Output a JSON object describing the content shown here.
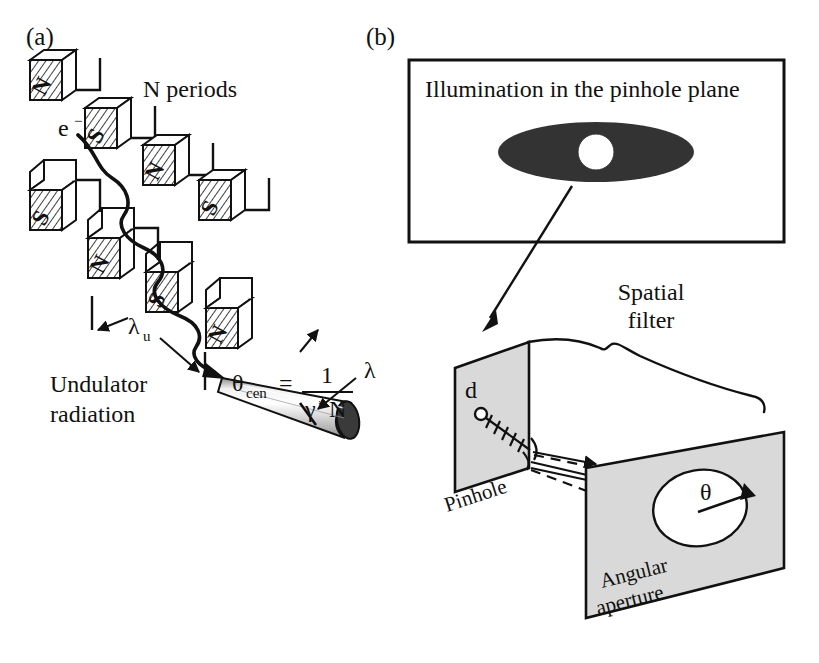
{
  "figure": {
    "panels": [
      {
        "key": "a",
        "label": "(a)"
      },
      {
        "key": "b",
        "label": "(b)"
      }
    ]
  },
  "panel_a": {
    "panel_label": "(a)",
    "n_periods_label": "N periods",
    "electron_label": "e",
    "electron_charge_sup": "−",
    "period_symbol": "λ",
    "period_subscript": "u",
    "wavelength_symbol": "λ",
    "caption_line1": "Undulator",
    "caption_line2": "radiation",
    "formula": {
      "theta_symbol": "θ",
      "theta_subscript": "cen",
      "equals": "=",
      "numerator": "1",
      "denominator_gamma": "γ",
      "denominator_star": "*",
      "denominator_n": "N"
    },
    "magnets": {
      "top_row_poles": [
        "N",
        "S",
        "N",
        "S"
      ],
      "bottom_row_poles": [
        "S",
        "N",
        "S",
        "N"
      ]
    }
  },
  "panel_b": {
    "panel_label": "(b)",
    "inset_box": {
      "title": "Illumination in the pinhole plane",
      "ellipse_fill": "#333333",
      "pinhole_fill": "#ffffff"
    },
    "spatial_filter_label_line1": "Spatial",
    "spatial_filter_label_line2": "filter",
    "pinhole_plane": {
      "distance_label": "d",
      "plane_label": "Pinhole",
      "fill": "#d9d9d9"
    },
    "angular_aperture_plane": {
      "angle_symbol": "θ",
      "plane_label_line1": "Angular",
      "plane_label_line2": "aperture",
      "fill": "#d9d9d9"
    }
  },
  "colors": {
    "ink": "#111111",
    "plane_gray": "#d9d9d9",
    "beam_gray": "#c9c9c9",
    "ellipse_dark": "#333333",
    "background": "#ffffff"
  }
}
